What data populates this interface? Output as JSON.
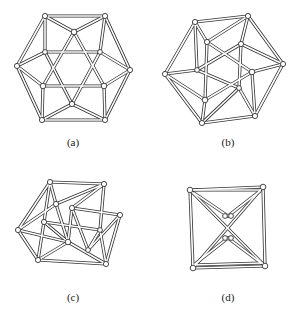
{
  "figure": {
    "panels": [
      {
        "id": "a",
        "label": "(a)",
        "description": "cuboctahedron wireframe (front view)"
      },
      {
        "id": "b",
        "label": "(b)",
        "description": "cuboctahedron wireframe, twisted view"
      },
      {
        "id": "c",
        "label": "(c)",
        "description": "intermediate twisted contraction"
      },
      {
        "id": "d",
        "label": "(d)",
        "description": "octahedron wireframe (collapsed)"
      }
    ]
  }
}
